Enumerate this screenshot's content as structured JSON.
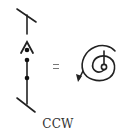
{
  "diagram": {
    "left_symbol": {
      "description": "vertical staff with slashed ends, a caret and three dots",
      "parts": [
        "top-slash",
        "vertical-line",
        "caret",
        "dot",
        "dot",
        "dot",
        "bottom-slash"
      ]
    },
    "operator": "=",
    "right_symbol": {
      "description": "spiral with counter-clockwise arrow",
      "icon": "ccw-spiral-icon"
    },
    "caption": "CCW"
  },
  "colors": {
    "stroke": "#222222",
    "background": "#ffffff",
    "caption": "#333333"
  }
}
